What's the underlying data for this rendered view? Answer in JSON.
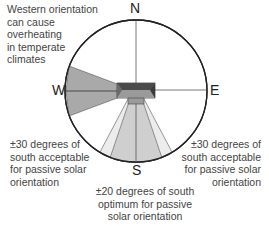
{
  "compass": {
    "north": "N",
    "south": "S",
    "east": "E",
    "west": "W"
  },
  "annotations": {
    "west_warning": [
      "Western orientation",
      "can cause",
      "overheating",
      "in temperate",
      "climates"
    ],
    "acceptable_left": [
      "±30 degrees of",
      "south acceptable",
      "for passive solar",
      "orientation"
    ],
    "acceptable_right": [
      "±30 degrees of",
      "south acceptable",
      "for passive solar",
      "orientation"
    ],
    "optimum": [
      "±20 degrees of south",
      "optimum for passive",
      "solar orientation"
    ]
  },
  "colors": {
    "west_sector": "#a9a9a9",
    "south_outer": "#ececec",
    "south_inner": "#cfcfcf",
    "house_dark": "#4a4a4a",
    "house_mid": "#8a8a8a",
    "outline": "#222222"
  }
}
